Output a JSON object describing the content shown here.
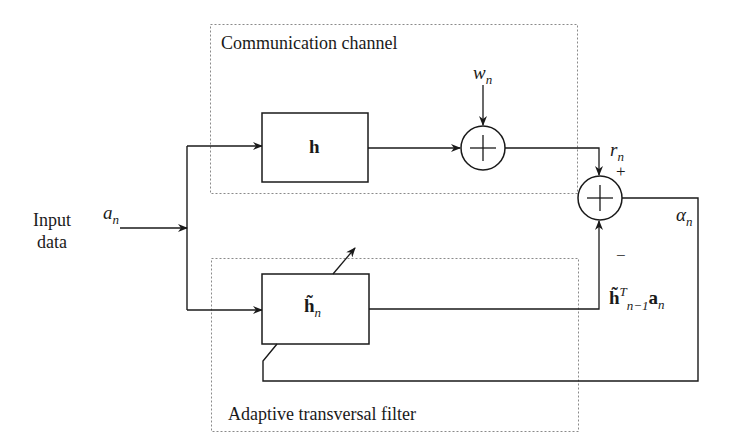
{
  "diagram": {
    "groups": {
      "channel": {
        "title": "Communication channel"
      },
      "filter": {
        "title": "Adaptive transversal filter"
      }
    },
    "input": {
      "line1": "Input",
      "line2": "data",
      "symbol": "a",
      "symbol_sub": "n"
    },
    "blocks": {
      "channel_block": {
        "label": "h"
      },
      "filter_block": {
        "label": "h̃",
        "label_sub": "n"
      }
    },
    "noise": {
      "symbol": "w",
      "symbol_sub": "n"
    },
    "received": {
      "symbol": "r",
      "symbol_sub": "n"
    },
    "error": {
      "symbol": "α",
      "symbol_sub": "n"
    },
    "estimate": {
      "base": "h̃",
      "sup": "T",
      "sub": "n−1",
      "vec": "a",
      "vec_sub": "n"
    },
    "signs": {
      "plus": "+",
      "minus": "−"
    },
    "colors": {
      "line": "#1a1a1a",
      "dotted": "#8a8a8a"
    }
  }
}
